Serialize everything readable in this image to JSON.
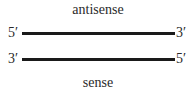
{
  "diagram": {
    "top_label": "antisense",
    "bottom_label": "sense",
    "strands": [
      {
        "name": "antisense",
        "left_end": "5′",
        "right_end": "3′"
      },
      {
        "name": "sense",
        "left_end": "3′",
        "right_end": "5′"
      }
    ],
    "line_color": "#1a1a1a"
  }
}
